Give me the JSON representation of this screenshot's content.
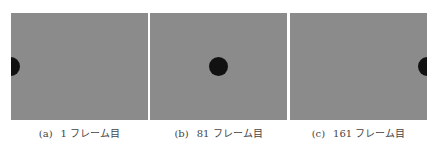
{
  "figure": {
    "panels": [
      {
        "id": "a",
        "tag": "(a)",
        "label": "1 フレーム目",
        "ball_x_in_panel": 0
      },
      {
        "id": "b",
        "tag": "(b)",
        "label": "81 フレーム目",
        "ball_x_in_panel": 69
      },
      {
        "id": "c",
        "tag": "(c)",
        "label": "161 フレーム目",
        "ball_x_in_panel": 138
      }
    ],
    "colors": {
      "background": "#8b8b8b",
      "ball": "#111111"
    }
  }
}
